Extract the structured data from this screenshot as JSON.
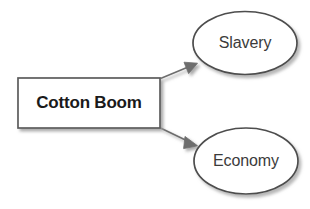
{
  "diagram": {
    "type": "cause-effect-flow",
    "background_color": "#ffffff",
    "nodes": [
      {
        "id": "cotton-boom",
        "label": "Cotton Boom",
        "shape": "rectangle",
        "text_color": "#1a1a1a",
        "fill_color": "#ffffff",
        "border_color": "#595959",
        "bold": true
      },
      {
        "id": "slavery",
        "label": "Slavery",
        "shape": "ellipse",
        "text_color": "#3b3b3b",
        "fill_color": "#ffffff",
        "border_color": "#4a4a4a",
        "bold": false
      },
      {
        "id": "economy",
        "label": "Economy",
        "shape": "ellipse",
        "text_color": "#3b3b3b",
        "fill_color": "#ffffff",
        "border_color": "#4a4a4a",
        "bold": false
      }
    ],
    "connectors": [
      {
        "id": "arrow-cotton-boom-to-slavery",
        "from": "cotton-boom",
        "to": "slavery",
        "style": "solid-arrow",
        "color": "#6b6b6b"
      },
      {
        "id": "arrow-cotton-boom-to-economy",
        "from": "cotton-boom",
        "to": "economy",
        "style": "solid-arrow",
        "color": "#6b6b6b"
      }
    ]
  }
}
